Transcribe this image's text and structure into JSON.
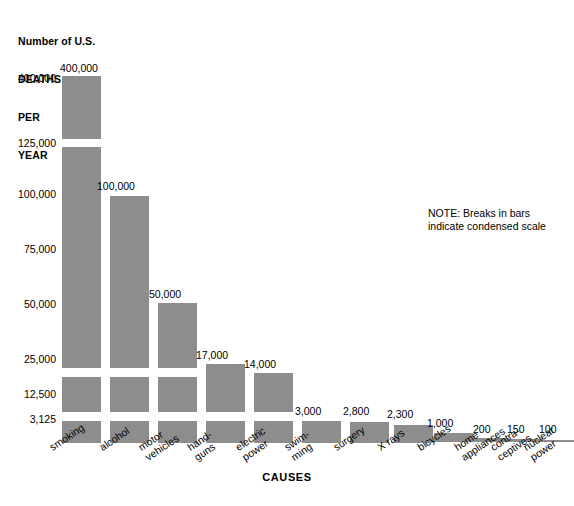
{
  "axis_title": {
    "line1": "Number of U.S.",
    "line2": "DEATHS",
    "line3": "PER",
    "line4": "YEAR"
  },
  "note": {
    "line1": "NOTE: Breaks in bars",
    "line2": "indicate condensed scale"
  },
  "xaxis_title": "CAUSES",
  "colors": {
    "bar": "#8d8d8d",
    "text": "#000000",
    "background": "#ffffff"
  },
  "chart_data": {
    "type": "bar",
    "title": "Number of U.S. DEATHS PER YEAR",
    "xlabel": "CAUSES",
    "ylabel": "Number of U.S. DEATHS PER YEAR",
    "grid": false,
    "legend": null,
    "scale_note": "NOTE: Breaks in bars indicate condensed scale",
    "axis_type": "condensed / broken (piecewise) scale",
    "ytick_labels": [
      "400,000",
      "125,000",
      "100,000",
      "75,000",
      "50,000",
      "25,000",
      "12,500",
      "3,125"
    ],
    "ytick_values": [
      400000,
      125000,
      100000,
      75000,
      50000,
      25000,
      12500,
      3125
    ],
    "categories": [
      "smoking",
      "alcohol",
      "motor vehicles",
      "hand-guns",
      "electric power",
      "swim-ming",
      "surgery",
      "X rays",
      "bicycles",
      "home appliances",
      "contra-ceptives",
      "nuclear power"
    ],
    "category_lines": [
      [
        "smoking"
      ],
      [
        "alcohol"
      ],
      [
        "motor",
        "vehicles"
      ],
      [
        "hand-",
        "guns"
      ],
      [
        "electric",
        "power"
      ],
      [
        "swim-",
        "ming"
      ],
      [
        "surgery"
      ],
      [
        "X rays"
      ],
      [
        "bicycles"
      ],
      [
        "home",
        "appliances"
      ],
      [
        "contra-",
        "ceptives"
      ],
      [
        "nuclear",
        "power"
      ]
    ],
    "values": [
      400000,
      100000,
      50000,
      17000,
      14000,
      3000,
      2800,
      2300,
      1000,
      200,
      150,
      100
    ],
    "value_labels": [
      "400,000",
      "100,000",
      "50,000",
      "17,000",
      "14,000",
      "3,000",
      "2,800",
      "2,300",
      "1,000",
      "200",
      "150",
      "100"
    ]
  },
  "bars": [
    {
      "name": "smoking",
      "value_label": "400,000",
      "lines": [
        "smoking"
      ],
      "x": 62,
      "width": 39,
      "label_x": 60,
      "label_y": 62,
      "cat_x": 47,
      "cat_y": 443,
      "segments": [
        {
          "top": 76,
          "height": 63
        },
        {
          "top": 147,
          "height": 221
        },
        {
          "top": 377,
          "height": 35
        },
        {
          "top": 421,
          "height": 22
        }
      ]
    },
    {
      "name": "alcohol",
      "value_label": "100,000",
      "lines": [
        "alcohol"
      ],
      "x": 110,
      "width": 39,
      "label_x": 97,
      "label_y": 180,
      "cat_x": 97,
      "cat_y": 443,
      "segments": [
        {
          "top": 196,
          "height": 172
        },
        {
          "top": 377,
          "height": 35
        },
        {
          "top": 421,
          "height": 22
        }
      ]
    },
    {
      "name": "motor-vehicles",
      "value_label": "50,000",
      "lines": [
        "motor",
        "vehicles"
      ],
      "x": 158,
      "width": 39,
      "label_x": 149,
      "label_y": 288,
      "cat_x": 136,
      "cat_y": 443,
      "segments": [
        {
          "top": 303,
          "height": 65
        },
        {
          "top": 377,
          "height": 35
        },
        {
          "top": 421,
          "height": 22
        }
      ]
    },
    {
      "name": "handguns",
      "value_label": "17,000",
      "lines": [
        "hand-",
        "guns"
      ],
      "x": 206,
      "width": 39,
      "label_x": 196,
      "label_y": 349,
      "cat_x": 185,
      "cat_y": 443,
      "segments": [
        {
          "top": 364,
          "height": 48
        },
        {
          "top": 421,
          "height": 22
        }
      ]
    },
    {
      "name": "electric-power",
      "value_label": "14,000",
      "lines": [
        "electric",
        "power"
      ],
      "x": 254,
      "width": 39,
      "label_x": 244,
      "label_y": 358,
      "cat_x": 233,
      "cat_y": 443,
      "segments": [
        {
          "top": 373,
          "height": 39
        },
        {
          "top": 421,
          "height": 22
        }
      ]
    },
    {
      "name": "swimming",
      "value_label": "3,000",
      "lines": [
        "swim-",
        "ming"
      ],
      "x": 302,
      "width": 39,
      "label_x": 295,
      "label_y": 405,
      "cat_x": 282,
      "cat_y": 443,
      "segments": [
        {
          "top": 421,
          "height": 22
        }
      ]
    },
    {
      "name": "surgery",
      "value_label": "2,800",
      "lines": [
        "surgery"
      ],
      "x": 350,
      "width": 39,
      "label_x": 343,
      "label_y": 405,
      "cat_x": 331,
      "cat_y": 443,
      "segments": [
        {
          "top": 422,
          "height": 21
        }
      ]
    },
    {
      "name": "x-rays",
      "value_label": "2,300",
      "lines": [
        "X rays"
      ],
      "x": 394,
      "width": 39,
      "label_x": 387,
      "label_y": 408,
      "cat_x": 375,
      "cat_y": 443,
      "segments": [
        {
          "top": 425,
          "height": 18
        }
      ]
    },
    {
      "name": "bicycles",
      "value_label": "1,000",
      "lines": [
        "bicycles"
      ],
      "x": 434,
      "width": 39,
      "label_x": 427,
      "label_y": 417,
      "cat_x": 415,
      "cat_y": 443,
      "segments": [
        {
          "top": 433,
          "height": 9
        }
      ]
    },
    {
      "name": "home-appliances",
      "value_label": "200",
      "lines": [
        "home",
        "appliances"
      ],
      "x": 470,
      "width": 39,
      "label_x": 473,
      "label_y": 423,
      "cat_x": 452,
      "cat_y": 443,
      "segments": [
        {
          "top": 438,
          "height": 4
        }
      ]
    },
    {
      "name": "contraceptives",
      "value_label": "150",
      "lines": [
        "contra-",
        "ceptives"
      ],
      "x": 504,
      "width": 39,
      "label_x": 507,
      "label_y": 423,
      "cat_x": 488,
      "cat_y": 443,
      "segments": [
        {
          "top": 439,
          "height": 3
        }
      ]
    },
    {
      "name": "nuclear-power",
      "value_label": "100",
      "lines": [
        "nuclear",
        "power"
      ],
      "x": 536,
      "width": 38,
      "label_x": 539,
      "label_y": 423,
      "cat_x": 521,
      "cat_y": 443,
      "segments": [
        {
          "top": 440,
          "height": 2
        }
      ]
    }
  ],
  "yticks": [
    {
      "label": "400,000",
      "y": 78
    },
    {
      "label": "125,000",
      "y": 143
    },
    {
      "label": "100,000",
      "y": 194
    },
    {
      "label": "75,000",
      "y": 249
    },
    {
      "label": "50,000",
      "y": 304
    },
    {
      "label": "25,000",
      "y": 359
    },
    {
      "label": "12,500",
      "y": 394
    },
    {
      "label": "3,125",
      "y": 419
    }
  ]
}
